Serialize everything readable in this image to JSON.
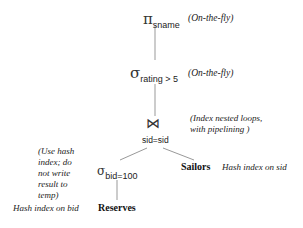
{
  "diagram": {
    "type": "query-evaluation-plan",
    "nodes": {
      "projection": {
        "symbol": "π",
        "subscript": "sname",
        "annotation": "(On-the-fly)"
      },
      "selection_rating": {
        "symbol": "σ",
        "subscript": "rating > 5",
        "annotation": "(On-the-fly)"
      },
      "join": {
        "symbol": "⋈",
        "condition": "sid=sid",
        "annotation_line1": "(Index nested loops,",
        "annotation_line2": "with pipelining )"
      },
      "selection_bid": {
        "symbol": "σ",
        "subscript": "bid=100",
        "annotation_lines": [
          "(Use hash",
          "index; do",
          "not write",
          "result to",
          "temp)"
        ]
      },
      "reserves": {
        "label": "Reserves",
        "annotation": "Hash index on bid"
      },
      "sailors": {
        "label": "Sailors",
        "annotation": "Hash index on sid"
      }
    },
    "edges": [
      [
        "projection",
        "selection_rating"
      ],
      [
        "selection_rating",
        "join"
      ],
      [
        "join",
        "selection_bid"
      ],
      [
        "join",
        "sailors"
      ],
      [
        "selection_bid",
        "reserves"
      ]
    ]
  }
}
